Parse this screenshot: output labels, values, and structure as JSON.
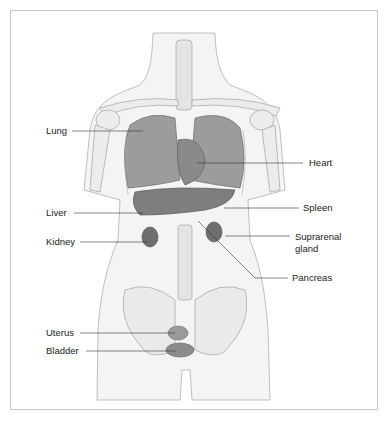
{
  "figure": {
    "labels": [
      {
        "id": "lung",
        "text": "Lung"
      },
      {
        "id": "heart",
        "text": "Heart"
      },
      {
        "id": "liver",
        "text": "Liver"
      },
      {
        "id": "spleen",
        "text": "Spleen"
      },
      {
        "id": "kidney",
        "text": "Kidney"
      },
      {
        "id": "suprarenal",
        "text": "Suprarenal"
      },
      {
        "id": "suprarenal2",
        "text": "gland"
      },
      {
        "id": "pancreas",
        "text": "Pancreas"
      },
      {
        "id": "uterus",
        "text": "Uterus"
      },
      {
        "id": "bladder",
        "text": "Bladder"
      }
    ],
    "colors": {
      "organ": "#8a8a8a",
      "organ_dark": "#6e6e6e",
      "bone": "#ececec",
      "outline": "#9a9a9a",
      "line": "#333333"
    }
  }
}
